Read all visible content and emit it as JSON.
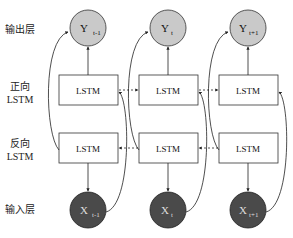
{
  "layers": {
    "output": "输出层",
    "forward_line1": "正向",
    "forward_line2": "LSTM",
    "backward_line1": "反向",
    "backward_line2": "LSTM",
    "input": "输入层"
  },
  "columns": [
    {
      "output": "Y",
      "output_sub": "t-1",
      "forward": "LSTM",
      "backward": "LSTM",
      "input": "X",
      "input_sub": "t-1"
    },
    {
      "output": "Y",
      "output_sub": "t",
      "forward": "LSTM",
      "backward": "LSTM",
      "input": "X",
      "input_sub": "t"
    },
    {
      "output": "Y",
      "output_sub": "t+1",
      "forward": "LSTM",
      "backward": "LSTM",
      "input": "X",
      "input_sub": "t+1"
    }
  ],
  "colors": {
    "output_fill": "#c9c9c9",
    "input_fill": "#4a4a4a",
    "box_stroke": "#333333",
    "line": "#222222"
  }
}
